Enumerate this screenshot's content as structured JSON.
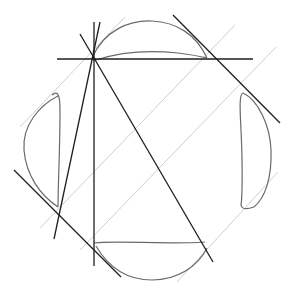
{
  "diagram": {
    "colors": {
      "background": "#ffffff",
      "construction_lines": "#1e1e1e",
      "guide_lines": "#cfcfcf",
      "curves": "#6a6a6a"
    },
    "element_groups": [
      {
        "name": "lens-curves",
        "count": 4,
        "labels": [
          "top",
          "left",
          "right",
          "bottom"
        ]
      },
      {
        "name": "construction-lines",
        "count": 6
      },
      {
        "name": "guide-lines",
        "count": 4
      }
    ]
  }
}
